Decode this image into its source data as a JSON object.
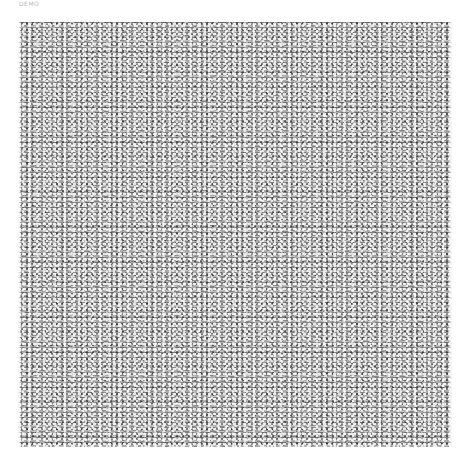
{
  "caption": "DEMO",
  "texture": {
    "description": "dense grayscale noise texture of distorted glyph fragments",
    "base_color": "#8a8a8a",
    "highlight_color": "#ffffff",
    "shadow_color": "#3a3a3a"
  }
}
